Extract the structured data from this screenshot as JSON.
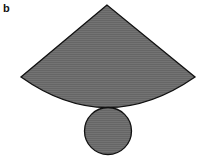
{
  "figure": {
    "panel_label": "b",
    "fill_color": "#6e6e6e",
    "stroke_color": "#111111",
    "shapes": [
      {
        "name": "sector",
        "role": "cone lateral surface"
      },
      {
        "name": "circle",
        "role": "cone base"
      }
    ]
  }
}
